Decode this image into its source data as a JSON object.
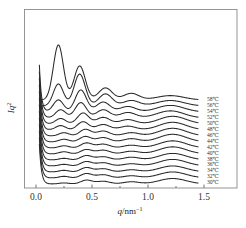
{
  "chart_data": {
    "type": "line",
    "title": "",
    "xlabel": "q/nm⁻¹",
    "xlabel_parts": {
      "var": "q",
      "unit": "/nm",
      "exp": "−1"
    },
    "ylabel": "Iq²",
    "ylabel_parts": {
      "var": "Iq",
      "exp": "2"
    },
    "xlim": [
      -0.1,
      1.8
    ],
    "xticks": [
      0.0,
      0.5,
      1.0,
      1.5
    ],
    "xtick_labels": [
      "0.0",
      "0.5",
      "1.0",
      "1.5"
    ],
    "minor_xticks": [
      0.25,
      0.75,
      1.25
    ],
    "yticks": [],
    "grid": false,
    "legend": "inline labels at right end of each curve",
    "offset_stacked": true,
    "x_range": [
      0.03,
      1.45
    ],
    "series": [
      {
        "name": "58℃",
        "label": "58℃",
        "peaks_q": [
          0.2,
          0.39,
          0.62,
          0.85,
          1.2
        ],
        "peak_heights": [
          1.0,
          0.62,
          0.22,
          0.12,
          0.08
        ]
      },
      {
        "name": "56℃",
        "label": "56℃",
        "peaks_q": [
          0.2,
          0.39,
          0.62,
          0.85,
          1.2
        ],
        "peak_heights": [
          0.4,
          0.58,
          0.22,
          0.1,
          0.1
        ]
      },
      {
        "name": "54℃",
        "label": "54℃",
        "peaks_q": [
          0.2,
          0.4,
          0.6,
          0.82,
          1.2
        ],
        "peak_heights": [
          0.22,
          0.4,
          0.18,
          0.1,
          0.12
        ]
      },
      {
        "name": "52℃",
        "label": "52℃",
        "peaks_q": [
          0.22,
          0.4,
          0.6,
          0.82,
          1.2
        ],
        "peak_heights": [
          0.15,
          0.28,
          0.15,
          0.1,
          0.13
        ]
      },
      {
        "name": "50℃",
        "label": "50℃",
        "peaks_q": [
          0.22,
          0.42,
          0.6,
          0.82,
          1.22
        ],
        "peak_heights": [
          0.1,
          0.2,
          0.12,
          0.08,
          0.14
        ]
      },
      {
        "name": "48℃",
        "label": "48℃",
        "peaks_q": [
          0.22,
          0.42,
          0.6,
          0.82,
          1.22
        ],
        "peak_heights": [
          0.08,
          0.15,
          0.1,
          0.07,
          0.14
        ]
      },
      {
        "name": "46℃",
        "label": "46℃",
        "peaks_q": [
          0.25,
          0.44,
          0.6,
          0.85,
          1.22
        ],
        "peak_heights": [
          0.06,
          0.12,
          0.09,
          0.06,
          0.14
        ]
      },
      {
        "name": "44℃",
        "label": "44℃",
        "peaks_q": [
          0.25,
          0.44,
          0.6,
          0.85,
          1.22
        ],
        "peak_heights": [
          0.05,
          0.1,
          0.08,
          0.06,
          0.14
        ]
      },
      {
        "name": "42℃",
        "label": "42℃",
        "peaks_q": [
          0.25,
          0.45,
          0.6,
          0.85,
          1.22
        ],
        "peak_heights": [
          0.04,
          0.09,
          0.07,
          0.05,
          0.13
        ]
      },
      {
        "name": "40℃",
        "label": "40℃",
        "peaks_q": [
          0.25,
          0.45,
          0.6,
          0.85,
          1.22
        ],
        "peak_heights": [
          0.04,
          0.08,
          0.07,
          0.05,
          0.13
        ]
      },
      {
        "name": "38℃",
        "label": "38℃",
        "peaks_q": [
          0.25,
          0.45,
          0.6,
          0.85,
          1.22
        ],
        "peak_heights": [
          0.03,
          0.08,
          0.06,
          0.05,
          0.12
        ]
      },
      {
        "name": "36℃",
        "label": "36℃",
        "peaks_q": [
          0.25,
          0.45,
          0.6,
          0.85,
          1.22
        ],
        "peak_heights": [
          0.03,
          0.08,
          0.06,
          0.04,
          0.12
        ]
      },
      {
        "name": "34℃",
        "label": "34℃",
        "peaks_q": [
          0.25,
          0.45,
          0.6,
          0.85,
          1.22
        ],
        "peak_heights": [
          0.03,
          0.08,
          0.06,
          0.04,
          0.11
        ]
      },
      {
        "name": "32℃",
        "label": "32℃",
        "peaks_q": [
          0.25,
          0.45,
          0.6,
          0.85,
          1.22
        ],
        "peak_heights": [
          0.03,
          0.08,
          0.06,
          0.04,
          0.11
        ]
      },
      {
        "name": "30℃",
        "label": "30℃",
        "peaks_q": [
          0.25,
          0.45,
          0.6,
          0.85,
          1.22
        ],
        "peak_heights": [
          0.02,
          0.07,
          0.05,
          0.04,
          0.1
        ]
      }
    ]
  },
  "colors": {
    "curve": "#2a2a2a",
    "frame": "#8a8a8a",
    "text": "#333333"
  }
}
